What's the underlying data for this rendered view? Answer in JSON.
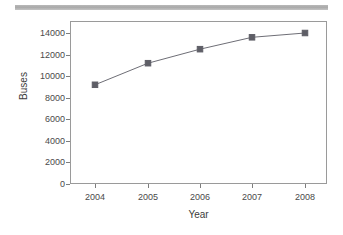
{
  "decor": {
    "top_bar_color": "#b0b0b0"
  },
  "chart_data": {
    "type": "line",
    "title": "",
    "subtitle": "",
    "xlabel": "Year",
    "ylabel": "Buses",
    "categories": [
      "2004",
      "2005",
      "2006",
      "2007",
      "2008"
    ],
    "x": [
      2004,
      2005,
      2006,
      2007,
      2008
    ],
    "values": [
      9200,
      11200,
      12500,
      13600,
      14000
    ],
    "series": [
      {
        "name": "Buses",
        "values": [
          9200,
          11200,
          12500,
          13600,
          14000
        ]
      }
    ],
    "xtick_labels": [
      "2004",
      "2005",
      "2006",
      "2007",
      "2008"
    ],
    "ytick_labels": [
      "0",
      "2000",
      "4000",
      "6000",
      "8000",
      "10000",
      "12000",
      "14000"
    ],
    "ytick_values": [
      0,
      2000,
      4000,
      6000,
      8000,
      10000,
      12000,
      14000
    ],
    "ylim": [
      0,
      15000
    ],
    "xlim": [
      2003.6,
      2008.4
    ],
    "grid": false,
    "legend": false,
    "legend_position": "none",
    "marker": "square",
    "line_color": "#6e6e76",
    "marker_color": "#5e5e66",
    "frame_color": "#9a9a9a",
    "annotations": []
  }
}
